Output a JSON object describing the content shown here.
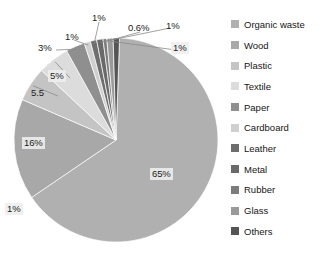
{
  "chart_data": {
    "type": "pie",
    "title": "",
    "legend_position": "right",
    "grid": false,
    "categories": [
      "Organic waste",
      "Wood",
      "Plastic",
      "Textile",
      "Paper",
      "Cardboard",
      "Leather",
      "Metal",
      "Rubber",
      "Glass",
      "Others"
    ],
    "values": [
      65,
      16,
      5.5,
      5,
      3,
      1,
      1,
      1,
      0.6,
      1,
      1
    ],
    "value_labels": [
      "65%",
      "16%",
      "5.5",
      "5%",
      "3%",
      "1%",
      "1%",
      "1%",
      "0.6%",
      "1%",
      "1%"
    ],
    "units": "percent",
    "colors": [
      "#b0b0b0",
      "#a8a8a8",
      "#c4c4c4",
      "#dcdcdc",
      "#8f8f8f",
      "#cfcfcf",
      "#6e6e6e",
      "#6a6a6a",
      "#7c7c7c",
      "#9a9a9a",
      "#555555"
    ],
    "slices": [
      {
        "label": "Organic waste",
        "value": 65,
        "value_label": "65%",
        "color": "#b0b0b0"
      },
      {
        "label": "Wood",
        "value": 16,
        "value_label": "16%",
        "color": "#a8a8a8"
      },
      {
        "label": "Plastic",
        "value": 5.5,
        "value_label": "5.5",
        "color": "#c4c4c4"
      },
      {
        "label": "Textile",
        "value": 5,
        "value_label": "5%",
        "color": "#dcdcdc"
      },
      {
        "label": "Paper",
        "value": 3,
        "value_label": "3%",
        "color": "#8f8f8f"
      },
      {
        "label": "Cardboard",
        "value": 1,
        "value_label": "1%",
        "color": "#cfcfcf"
      },
      {
        "label": "Leather",
        "value": 1,
        "value_label": "1%",
        "color": "#6e6e6e"
      },
      {
        "label": "Metal",
        "value": 1,
        "value_label": "1%",
        "color": "#6a6a6a"
      },
      {
        "label": "Rubber",
        "value": 0.6,
        "value_label": "0.6%",
        "color": "#7c7c7c"
      },
      {
        "label": "Glass",
        "value": 1,
        "value_label": "1%",
        "color": "#9a9a9a"
      },
      {
        "label": "Others",
        "value": 1,
        "value_label": "1%",
        "color": "#555555"
      }
    ]
  },
  "labels": {
    "organic_waste": "65%",
    "wood": "16%",
    "plastic": "5.5",
    "textile": "5%",
    "paper": "3%",
    "cardboard": "1%",
    "leather": "1%",
    "metal": "1%",
    "rubber": "0.6%",
    "glass": "1%",
    "others": "1%"
  },
  "legend": {
    "items": [
      {
        "label": "Organic waste",
        "color": "#b0b0b0"
      },
      {
        "label": "Wood",
        "color": "#a8a8a8"
      },
      {
        "label": "Plastic",
        "color": "#c4c4c4"
      },
      {
        "label": "Textile",
        "color": "#dcdcdc"
      },
      {
        "label": "Paper",
        "color": "#8f8f8f"
      },
      {
        "label": "Cardboard",
        "color": "#cfcfcf"
      },
      {
        "label": "Leather",
        "color": "#6e6e6e"
      },
      {
        "label": "Metal",
        "color": "#6a6a6a"
      },
      {
        "label": "Rubber",
        "color": "#7c7c7c"
      },
      {
        "label": "Glass",
        "color": "#9a9a9a"
      },
      {
        "label": "Others",
        "color": "#555555"
      }
    ]
  }
}
